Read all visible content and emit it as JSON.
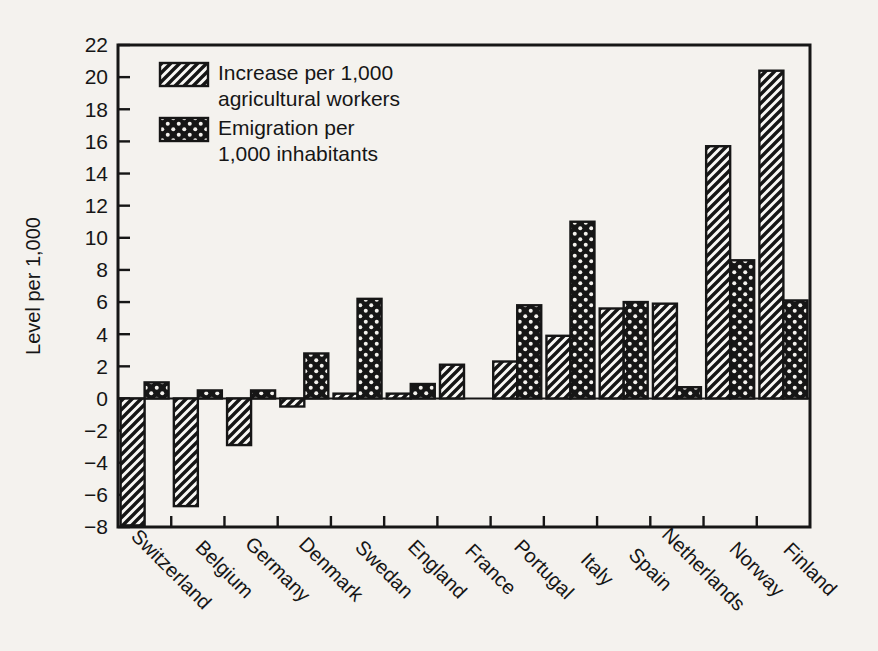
{
  "figure": {
    "background": "#f4f2ee",
    "ink": "#161616"
  },
  "chart_data": {
    "type": "bar",
    "title": "",
    "xlabel": "",
    "ylabel": "Level per 1,000",
    "ylim": [
      -8,
      22
    ],
    "ytick_step": 2,
    "grid": false,
    "legend_position": "top-left",
    "categories": [
      "Switzerland",
      "Belgium",
      "Germany",
      "Denmark",
      "Swedan",
      "England",
      "France",
      "Portugal",
      "Italy",
      "Spain",
      "Netherlands",
      "Norway",
      "Finland"
    ],
    "series": [
      {
        "name": "Increase per 1,000 agricultural workers",
        "legend_lines": [
          "Increase per 1,000",
          "agricultural workers"
        ],
        "pattern": "diagonal-hatch",
        "values": [
          -7.9,
          -6.7,
          -2.9,
          -0.5,
          0.3,
          0.3,
          2.1,
          2.3,
          3.9,
          5.6,
          5.9,
          15.7,
          20.4
        ]
      },
      {
        "name": "Emigration per 1,000 inhabitants",
        "legend_lines": [
          "Emigration per",
          "1,000 inhabitants"
        ],
        "pattern": "black-dotted",
        "values": [
          1.0,
          0.5,
          0.5,
          2.8,
          6.2,
          0.9,
          0,
          5.8,
          11.0,
          6.0,
          0.7,
          8.6,
          6.1
        ]
      }
    ]
  }
}
